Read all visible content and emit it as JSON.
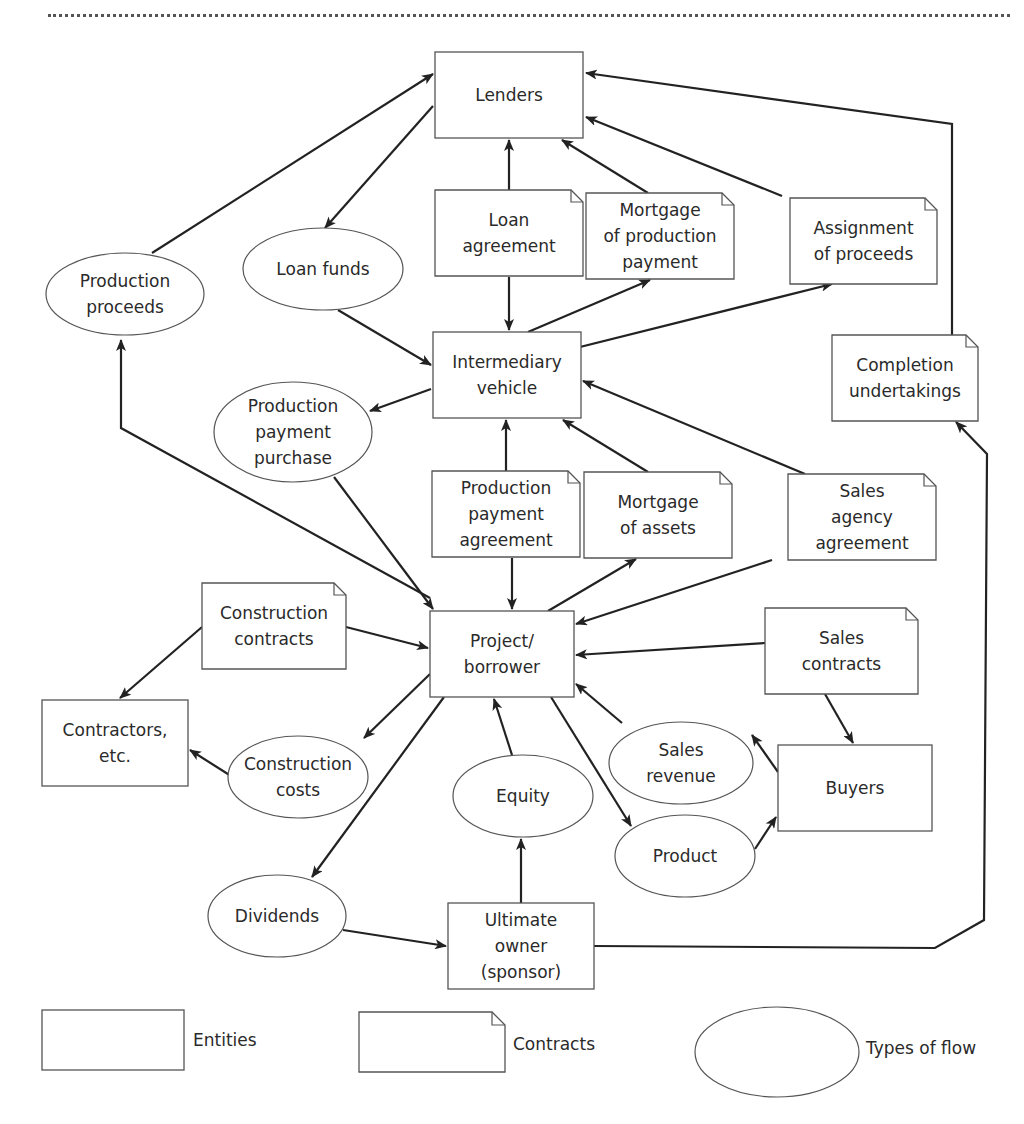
{
  "nodes": {
    "lenders": {
      "type": "entity",
      "lines": [
        "Lenders"
      ],
      "x": 435,
      "y": 52,
      "w": 148,
      "h": 86
    },
    "loan_agreement": {
      "type": "contract",
      "lines": [
        "Loan",
        "agreement"
      ],
      "x": 435,
      "y": 190,
      "w": 148,
      "h": 86
    },
    "mortgage_production_payment": {
      "type": "contract",
      "lines": [
        "Mortgage",
        "of production",
        "payment"
      ],
      "x": 586,
      "y": 193,
      "w": 148,
      "h": 86
    },
    "assignment_of_proceeds": {
      "type": "contract",
      "lines": [
        "Assignment",
        "of proceeds"
      ],
      "x": 790,
      "y": 198,
      "w": 147,
      "h": 86
    },
    "intermediary_vehicle": {
      "type": "entity",
      "lines": [
        "Intermediary",
        "vehicle"
      ],
      "x": 433,
      "y": 332,
      "w": 148,
      "h": 86
    },
    "completion_undertakings": {
      "type": "contract",
      "lines": [
        "Completion",
        "undertakings"
      ],
      "x": 832,
      "y": 335,
      "w": 146,
      "h": 86
    },
    "production_payment_agreement": {
      "type": "contract",
      "lines": [
        "Production",
        "payment",
        "agreement"
      ],
      "x": 432,
      "y": 471,
      "w": 148,
      "h": 86
    },
    "mortgage_of_assets": {
      "type": "contract",
      "lines": [
        "Mortgage",
        "of assets"
      ],
      "x": 584,
      "y": 472,
      "w": 148,
      "h": 86
    },
    "sales_agency_agreement": {
      "type": "contract",
      "lines": [
        "Sales",
        "agency",
        "agreement"
      ],
      "x": 788,
      "y": 474,
      "w": 148,
      "h": 86
    },
    "construction_contracts": {
      "type": "contract",
      "lines": [
        "Construction",
        "contracts"
      ],
      "x": 202,
      "y": 583,
      "w": 144,
      "h": 86
    },
    "project_borrower": {
      "type": "entity",
      "lines": [
        "Project/",
        "borrower"
      ],
      "x": 430,
      "y": 611,
      "w": 144,
      "h": 86
    },
    "sales_contracts": {
      "type": "contract",
      "lines": [
        "Sales",
        "contracts"
      ],
      "x": 765,
      "y": 608,
      "w": 153,
      "h": 86
    },
    "contractors": {
      "type": "entity",
      "lines": [
        "Contractors,",
        "etc."
      ],
      "x": 42,
      "y": 700,
      "w": 146,
      "h": 86
    },
    "buyers": {
      "type": "entity",
      "lines": [
        "Buyers"
      ],
      "x": 778,
      "y": 745,
      "w": 154,
      "h": 86
    },
    "ultimate_owner": {
      "type": "entity",
      "lines": [
        "Ultimate",
        "owner",
        "(sponsor)"
      ],
      "x": 448,
      "y": 903,
      "w": 146,
      "h": 86
    },
    "production_proceeds": {
      "type": "flow",
      "lines": [
        "Production",
        "proceeds"
      ],
      "cx": 125,
      "cy": 294,
      "rx": 79,
      "ry": 41
    },
    "loan_funds": {
      "type": "flow",
      "lines": [
        "Loan funds"
      ],
      "cx": 323,
      "cy": 269,
      "rx": 80,
      "ry": 41
    },
    "production_payment_purchase": {
      "type": "flow",
      "lines": [
        "Production",
        "payment",
        "purchase"
      ],
      "cx": 293,
      "cy": 432,
      "rx": 79,
      "ry": 50
    },
    "sales_revenue": {
      "type": "flow",
      "lines": [
        "Sales",
        "revenue"
      ],
      "cx": 681,
      "cy": 763,
      "rx": 72,
      "ry": 41
    },
    "construction_costs": {
      "type": "flow",
      "lines": [
        "Construction",
        "costs"
      ],
      "cx": 298,
      "cy": 777,
      "rx": 70,
      "ry": 41
    },
    "equity": {
      "type": "flow",
      "lines": [
        "Equity"
      ],
      "cx": 523,
      "cy": 796,
      "rx": 70,
      "ry": 41
    },
    "product": {
      "type": "flow",
      "lines": [
        "Product"
      ],
      "cx": 685,
      "cy": 856,
      "rx": 70,
      "ry": 41
    },
    "dividends": {
      "type": "flow",
      "lines": [
        "Dividends"
      ],
      "cx": 277,
      "cy": 916,
      "rx": 69,
      "ry": 41
    }
  },
  "edges": [
    {
      "from": "production_proceeds",
      "to": "lenders",
      "points": [
        [
          152,
          253
        ],
        [
          433,
          74
        ]
      ]
    },
    {
      "from": "lenders",
      "to": "loan_funds",
      "points": [
        [
          433,
          106
        ],
        [
          325,
          228
        ]
      ]
    },
    {
      "from": "loan_agreement",
      "to": "lenders",
      "points": [
        [
          509,
          190
        ],
        [
          509,
          140
        ]
      ]
    },
    {
      "from": "mortgage_production_payment",
      "to": "lenders",
      "points": [
        [
          648,
          193
        ],
        [
          562,
          140
        ]
      ]
    },
    {
      "from": "assignment_of_proceeds",
      "to": "lenders",
      "points": [
        [
          782,
          196
        ],
        [
          586,
          117
        ]
      ]
    },
    {
      "from": "completion_undertakings",
      "to": "lenders",
      "points": [
        [
          952,
          335
        ],
        [
          952,
          124
        ],
        [
          586,
          73
        ]
      ]
    },
    {
      "from": "loan_agreement",
      "to": "intermediary_vehicle",
      "points": [
        [
          509,
          277
        ],
        [
          509,
          330
        ]
      ]
    },
    {
      "from": "intermediary_vehicle",
      "to": "mortgage_production_payment",
      "points": [
        [
          528,
          332
        ],
        [
          650,
          280
        ]
      ]
    },
    {
      "from": "intermediary_vehicle",
      "to": "assignment_of_proceeds",
      "points": [
        [
          560,
          352
        ],
        [
          832,
          284
        ]
      ]
    },
    {
      "from": "loan_funds",
      "to": "intermediary_vehicle",
      "points": [
        [
          338,
          310
        ],
        [
          431,
          365
        ]
      ]
    },
    {
      "from": "intermediary_vehicle",
      "to": "production_payment_purchase",
      "points": [
        [
          431,
          389
        ],
        [
          370,
          411
        ]
      ]
    },
    {
      "from": "production_payment_agreement",
      "to": "intermediary_vehicle",
      "points": [
        [
          506,
          471
        ],
        [
          506,
          420
        ]
      ]
    },
    {
      "from": "mortgage_of_assets",
      "to": "intermediary_vehicle",
      "points": [
        [
          648,
          472
        ],
        [
          563,
          420
        ]
      ]
    },
    {
      "from": "sales_agency_agreement",
      "to": "intermediary_vehicle",
      "points": [
        [
          805,
          474
        ],
        [
          583,
          381
        ]
      ]
    },
    {
      "from": "project_borrower",
      "to": "production_proceeds",
      "points": [
        [
          430,
          598
        ],
        [
          121,
          428
        ],
        [
          121,
          340
        ]
      ]
    },
    {
      "from": "production_payment_purchase",
      "to": "project_borrower",
      "points": [
        [
          334,
          477
        ],
        [
          433,
          609
        ]
      ]
    },
    {
      "from": "production_payment_agreement",
      "to": "project_borrower",
      "points": [
        [
          512,
          558
        ],
        [
          512,
          609
        ]
      ]
    },
    {
      "from": "project_borrower",
      "to": "mortgage_of_assets",
      "points": [
        [
          548,
          611
        ],
        [
          636,
          559
        ]
      ]
    },
    {
      "from": "sales_agency_agreement",
      "to": "project_borrower",
      "points": [
        [
          772,
          560
        ],
        [
          576,
          624
        ]
      ]
    },
    {
      "from": "construction_contracts",
      "to": "project_borrower",
      "points": [
        [
          346,
          627
        ],
        [
          428,
          648
        ]
      ]
    },
    {
      "from": "construction_contracts",
      "to": "contractors",
      "points": [
        [
          202,
          627
        ],
        [
          120,
          698
        ]
      ]
    },
    {
      "from": "sales_contracts",
      "to": "project_borrower",
      "points": [
        [
          765,
          643
        ],
        [
          576,
          655
        ]
      ]
    },
    {
      "from": "sales_contracts",
      "to": "buyers",
      "points": [
        [
          825,
          694
        ],
        [
          853,
          743
        ]
      ]
    },
    {
      "from": "sales_revenue",
      "to": "project_borrower",
      "points": [
        [
          622,
          723
        ],
        [
          576,
          684
        ]
      ]
    },
    {
      "from": "buyers",
      "to": "sales_revenue",
      "points": [
        [
          778,
          772
        ],
        [
          752,
          735
        ]
      ]
    },
    {
      "from": "project_borrower",
      "to": "construction_costs",
      "points": [
        [
          430,
          674
        ],
        [
          364,
          738
        ]
      ]
    },
    {
      "from": "construction_costs",
      "to": "contractors",
      "points": [
        [
          231,
          776
        ],
        [
          190,
          750
        ]
      ]
    },
    {
      "from": "equity",
      "to": "project_borrower",
      "points": [
        [
          512,
          755
        ],
        [
          494,
          699
        ]
      ]
    },
    {
      "from": "ultimate_owner",
      "to": "equity",
      "points": [
        [
          521,
          903
        ],
        [
          521,
          839
        ]
      ]
    },
    {
      "from": "project_borrower",
      "to": "product",
      "points": [
        [
          551,
          697
        ],
        [
          631,
          826
        ]
      ]
    },
    {
      "from": "product",
      "to": "buyers",
      "points": [
        [
          755,
          849
        ],
        [
          776,
          817
        ]
      ]
    },
    {
      "from": "project_borrower",
      "to": "dividends",
      "points": [
        [
          444,
          697
        ],
        [
          312,
          877
        ]
      ]
    },
    {
      "from": "dividends",
      "to": "ultimate_owner",
      "points": [
        [
          343,
          930
        ],
        [
          446,
          946
        ]
      ]
    },
    {
      "from": "ultimate_owner",
      "to": "completion_undertakings",
      "points": [
        [
          594,
          946
        ],
        [
          935,
          948
        ],
        [
          984,
          920
        ],
        [
          987,
          454
        ],
        [
          956,
          422
        ]
      ]
    }
  ],
  "legend": {
    "items": [
      {
        "shape": "entity",
        "label": "Entities"
      },
      {
        "shape": "contract",
        "label": "Contracts"
      },
      {
        "shape": "flow",
        "label": "Types of flow"
      }
    ]
  },
  "colors": {
    "stroke": "#222222",
    "shape_outline": "#555555",
    "text": "#2a2a2a",
    "background": "#ffffff"
  }
}
